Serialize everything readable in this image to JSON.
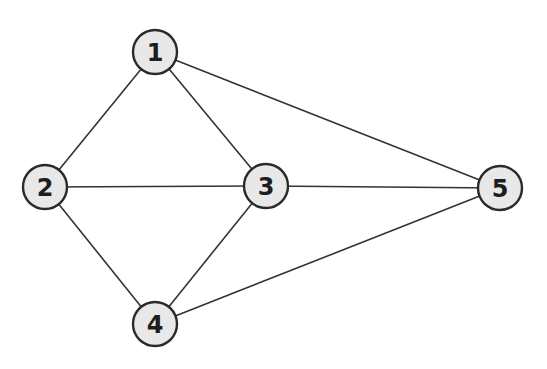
{
  "graph": {
    "nodes": [
      {
        "id": "1",
        "label": "1",
        "x": 155,
        "y": 52
      },
      {
        "id": "2",
        "label": "2",
        "x": 45,
        "y": 187
      },
      {
        "id": "3",
        "label": "3",
        "x": 266,
        "y": 186
      },
      {
        "id": "4",
        "label": "4",
        "x": 155,
        "y": 324
      },
      {
        "id": "5",
        "label": "5",
        "x": 500,
        "y": 188
      }
    ],
    "edges": [
      {
        "from": "1",
        "to": "2"
      },
      {
        "from": "1",
        "to": "3"
      },
      {
        "from": "1",
        "to": "5"
      },
      {
        "from": "2",
        "to": "3"
      },
      {
        "from": "2",
        "to": "4"
      },
      {
        "from": "3",
        "to": "4"
      },
      {
        "from": "3",
        "to": "5"
      },
      {
        "from": "4",
        "to": "5"
      }
    ],
    "colors": {
      "node_fill": "#e8e8e8",
      "node_stroke": "#2a2a2a",
      "edge": "#333333",
      "background": "#ffffff"
    }
  }
}
